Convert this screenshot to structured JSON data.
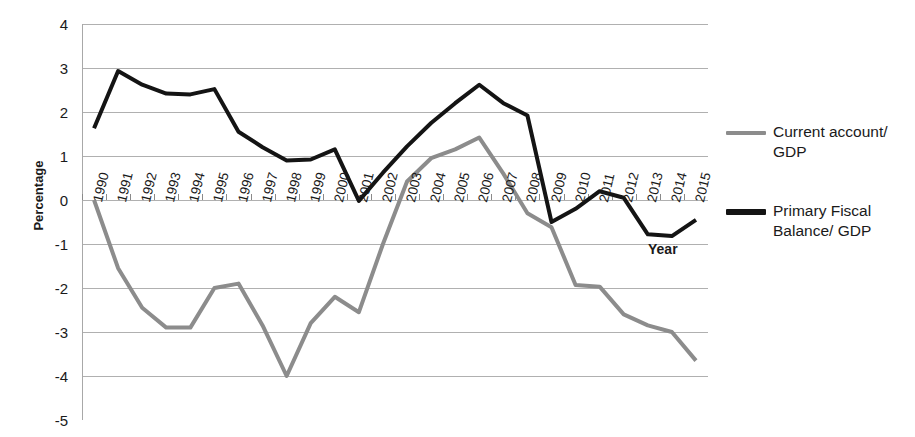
{
  "chart_data": {
    "type": "line",
    "title": "",
    "xlabel": "Year",
    "ylabel": "Percentage",
    "ylim": [
      -5,
      4
    ],
    "ytick_step": 1,
    "grid": true,
    "legend_position": "right",
    "categories": [
      "1990",
      "1991",
      "1992",
      "1993",
      "1994",
      "1995",
      "1996",
      "1997",
      "1998",
      "1999",
      "2000",
      "2001",
      "2002",
      "2003",
      "2004",
      "2005",
      "2006",
      "2007",
      "2008",
      "2009",
      "2010",
      "2011",
      "2012",
      "2013",
      "2014",
      "2015"
    ],
    "yticks": [
      "4",
      "3",
      "2",
      "1",
      "0",
      "-1",
      "-2",
      "-3",
      "-4",
      "-5"
    ],
    "series": [
      {
        "name": "Current account/ GDP",
        "color": "#8c8c8c",
        "width": 4,
        "values": [
          0.0,
          -1.55,
          -2.45,
          -2.9,
          -2.9,
          -2.0,
          -1.9,
          -2.85,
          -4.0,
          -2.8,
          -2.2,
          -2.55,
          -1.0,
          0.42,
          0.95,
          1.15,
          1.42,
          0.6,
          -0.3,
          -0.62,
          -1.93,
          -1.97,
          -2.6,
          -2.85,
          -3.0,
          -3.65
        ]
      },
      {
        "name": "Primary Fiscal Balance/ GDP",
        "color": "#141414",
        "width": 4,
        "values": [
          1.63,
          2.93,
          2.62,
          2.42,
          2.4,
          2.52,
          1.55,
          1.2,
          0.9,
          0.92,
          1.15,
          -0.02,
          0.62,
          1.22,
          1.75,
          2.2,
          2.62,
          2.2,
          1.92,
          -0.5,
          -0.2,
          0.2,
          0.05,
          -0.78,
          -0.82,
          -0.45
        ]
      }
    ]
  },
  "legend": {
    "entries": [
      {
        "label": "Current account/ GDP"
      },
      {
        "label": "Primary Fiscal Balance/ GDP"
      }
    ]
  },
  "axes": {
    "x_title": "Year",
    "y_title": "Percentage"
  }
}
